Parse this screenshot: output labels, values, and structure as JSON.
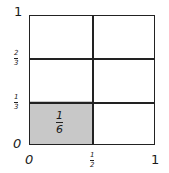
{
  "diagram": {
    "type": "unit-square-area-model",
    "y_axis": {
      "top": "1",
      "two_thirds": {
        "num": "2",
        "den": "3"
      },
      "one_third": {
        "num": "1",
        "den": "3"
      },
      "origin": "0"
    },
    "x_axis": {
      "origin": "0",
      "half": {
        "num": "1",
        "den": "2"
      },
      "right": "1"
    },
    "shaded_region": {
      "label": {
        "num": "1",
        "den": "6"
      },
      "color": "#c8c8c8"
    },
    "grid": {
      "columns": 2,
      "rows": 3
    }
  }
}
